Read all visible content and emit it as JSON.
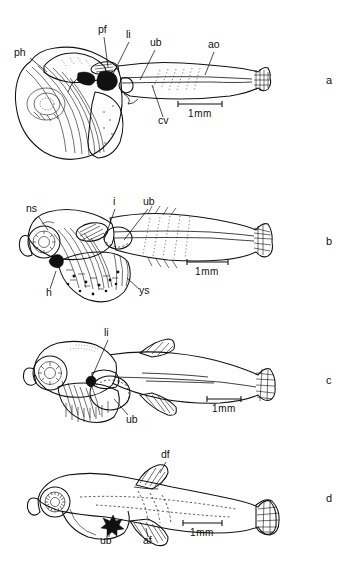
{
  "figure": {
    "background_color": "#ffffff",
    "ink_color": "#111111",
    "width": 349,
    "height": 566
  },
  "panels": [
    {
      "id": "a",
      "letter": "a",
      "letter_x": 326,
      "letter_y": 74,
      "scale_bar": {
        "label": "1mm",
        "x1": 178,
        "x2": 222,
        "y": 104,
        "label_x": 200,
        "label_y": 117
      },
      "labels": [
        {
          "text": "ph",
          "x": 14,
          "y": 56,
          "anchor": "start",
          "leader": "M 30 58 L 47 72"
        },
        {
          "text": "pf",
          "x": 98,
          "y": 33,
          "anchor": "start",
          "leader": "M 104 37 L 108 67"
        },
        {
          "text": "li",
          "x": 126,
          "y": 38,
          "anchor": "start",
          "leader": "M 129 42 L 112 76"
        },
        {
          "text": "ub",
          "x": 150,
          "y": 46,
          "anchor": "start",
          "leader": "M 155 50 L 140 80"
        },
        {
          "text": "ao",
          "x": 208,
          "y": 48,
          "anchor": "start",
          "leader": "M 214 52 L 205 75"
        },
        {
          "text": "cv",
          "x": 158,
          "y": 124,
          "anchor": "start",
          "leader": "M 163 117 L 152 85"
        }
      ]
    },
    {
      "id": "b",
      "letter": "b",
      "letter_x": 326,
      "letter_y": 235,
      "scale_bar": {
        "label": "1mm",
        "x1": 187,
        "x2": 228,
        "y": 262,
        "label_x": 207,
        "label_y": 275
      },
      "labels": [
        {
          "text": "ns",
          "x": 26,
          "y": 212,
          "anchor": "start",
          "leader": "M 38 216 L 48 230"
        },
        {
          "text": "i",
          "x": 113,
          "y": 205,
          "anchor": "start",
          "leader": "M 115 209 L 104 240"
        },
        {
          "text": "ub",
          "x": 143,
          "y": 205,
          "anchor": "start",
          "leader": "M 148 209 L 124 240"
        },
        {
          "text": "h",
          "x": 46,
          "y": 296,
          "anchor": "start",
          "leader": "M 50 289 L 56 271"
        },
        {
          "text": "ys",
          "x": 139,
          "y": 294,
          "anchor": "start",
          "leader": "M 139 289 L 127 278"
        }
      ]
    },
    {
      "id": "c",
      "letter": "c",
      "letter_x": 326,
      "letter_y": 374,
      "scale_bar": {
        "label": "1mm",
        "x1": 207,
        "x2": 241,
        "y": 399,
        "label_x": 224,
        "label_y": 412
      },
      "labels": [
        {
          "text": "li",
          "x": 104,
          "y": 336,
          "anchor": "start",
          "leader": "M 108 340 L 100 378"
        },
        {
          "text": "ub",
          "x": 126,
          "y": 421,
          "anchor": "start",
          "leader": "M 128 415 L 118 399"
        }
      ]
    },
    {
      "id": "d",
      "letter": "d",
      "letter_x": 326,
      "letter_y": 492,
      "scale_bar": {
        "label": "1mm",
        "x1": 183,
        "x2": 222,
        "y": 523,
        "label_x": 202,
        "label_y": 536
      },
      "labels": [
        {
          "text": "df",
          "x": 161,
          "y": 457,
          "anchor": "start",
          "leader": "M 166 461 L 160 472"
        },
        {
          "text": "ub",
          "x": 100,
          "y": 537,
          "anchor": "start",
          "leader": "M 108 530 L 110 514"
        },
        {
          "text": "af",
          "x": 143,
          "y": 537,
          "anchor": "start",
          "leader": "M 148 530 L 146 516"
        }
      ]
    }
  ],
  "abbreviations": {
    "ph": "pharynx",
    "pf": "pectoral fin",
    "li": "liver",
    "ub": "urinary bladder",
    "ao": "aorta",
    "cv": "cardinal vein",
    "ns": "nasal sac",
    "i": "intestine",
    "h": "heart",
    "ys": "yolk sac",
    "df": "dorsal fin",
    "af": "anal fin"
  }
}
